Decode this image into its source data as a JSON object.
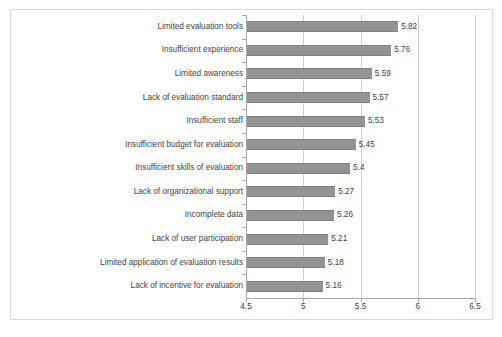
{
  "chart_data": {
    "type": "bar",
    "orientation": "horizontal",
    "title": "",
    "xlabel": "",
    "ylabel": "",
    "xlim": [
      4.5,
      6.5
    ],
    "xticks": [
      "4.5",
      "5",
      "5.5",
      "6",
      "6.5"
    ],
    "xtick_values": [
      4.5,
      5,
      5.5,
      6,
      6.5
    ],
    "grid": "vertical",
    "legend": "none",
    "bar_color": "#939393",
    "categories": [
      "Limited evaluation tools",
      "Insufficient experience",
      "Limited awareness",
      "Lack of evaluation standard",
      "Insufficient staff",
      "Insufficient budget for evaluation",
      "Insufficient skills of evaluation",
      "Lack of organizational support",
      "Incomplete data",
      "Lack of user participation",
      "Limited application of evaluation results",
      "Lack of incentive for evaluation"
    ],
    "values": [
      5.82,
      5.76,
      5.59,
      5.57,
      5.53,
      5.45,
      5.4,
      5.27,
      5.26,
      5.21,
      5.18,
      5.16
    ],
    "value_labels": [
      "5.82",
      "5.76",
      "5.59",
      "5.57",
      "5.53",
      "5.45",
      "5.4",
      "5.27",
      "5.26",
      "5.21",
      "5.18",
      "5.16"
    ]
  },
  "caption": {
    "text": "",
    "visible": false
  }
}
